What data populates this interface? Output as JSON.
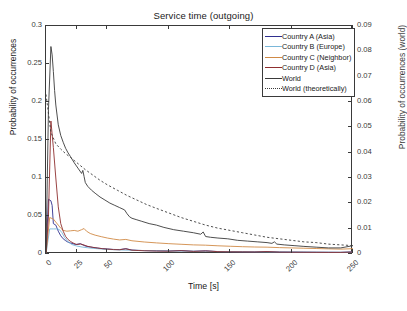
{
  "chart_data": {
    "type": "line",
    "title": "Service time (outgoing)",
    "xlabel": "Time [s]",
    "ylabel": "Probability of occurrences",
    "ylabel_right": "Probability of occurrences (world)",
    "xlim": [
      0,
      250
    ],
    "ylim": [
      0,
      0.3
    ],
    "ylim_right": [
      0,
      0.09
    ],
    "xticks": [
      0,
      25,
      50,
      100,
      150,
      200,
      250
    ],
    "xticklabels": [
      "0",
      "25",
      "50",
      "100",
      "150",
      "200",
      "250"
    ],
    "yticks": [
      0,
      0.05,
      0.1,
      0.15,
      0.2,
      0.25,
      0.3
    ],
    "yticklabels": [
      "0",
      "0.05",
      "0.1",
      "0.15",
      "0.2",
      "0.25",
      "0.3"
    ],
    "yticks_right": [
      0,
      0.01,
      0.02,
      0.03,
      0.04,
      0.05,
      0.06,
      0.07,
      0.08,
      0.09
    ],
    "yticklabels_right": [
      "0",
      "0.01",
      "0.02",
      "0.03",
      "0.04",
      "0.05",
      "0.06",
      "0.07",
      "0.08",
      "0.09"
    ],
    "grid": false,
    "legend_position": "top-right",
    "series": [
      {
        "name": "Country A (Asia)",
        "color": "#2f2f8f",
        "style": "solid",
        "axis": "left",
        "x": [
          0,
          2,
          4,
          5,
          6,
          8,
          10,
          12,
          14,
          16,
          18,
          20,
          24,
          28,
          32,
          36,
          40,
          45,
          50,
          55,
          60,
          65,
          70,
          75,
          80,
          90,
          100,
          110,
          120,
          130,
          140,
          150,
          160,
          170,
          180,
          190,
          200,
          210,
          220,
          230,
          240,
          250
        ],
        "y": [
          0.0,
          0.072,
          0.07,
          0.064,
          0.04,
          0.038,
          0.03,
          0.024,
          0.02,
          0.0175,
          0.0155,
          0.0145,
          0.0125,
          0.0135,
          0.0105,
          0.0092,
          0.0082,
          0.0072,
          0.0066,
          0.006,
          0.0058,
          0.007,
          0.0052,
          0.0048,
          0.0045,
          0.0042,
          0.004,
          0.0046,
          0.0036,
          0.0042,
          0.0032,
          0.003,
          0.0029,
          0.0028,
          0.0033,
          0.0026,
          0.0025,
          0.0024,
          0.0023,
          0.0022,
          0.0021,
          0.0028
        ]
      },
      {
        "name": "Country B (Europe)",
        "color": "#7ab7d9",
        "style": "solid",
        "axis": "left",
        "x": [
          0,
          3,
          6,
          9,
          11,
          13,
          15,
          18,
          21,
          25,
          30,
          35,
          40,
          45,
          50,
          60,
          70,
          80,
          90,
          100,
          110,
          120,
          130,
          140,
          150,
          160,
          170,
          180,
          190,
          200,
          210,
          220,
          230,
          240,
          250
        ],
        "y": [
          0.0,
          0.033,
          0.033,
          0.033,
          0.032,
          0.028,
          0.022,
          0.016,
          0.0125,
          0.0105,
          0.009,
          0.008,
          0.0072,
          0.0066,
          0.006,
          0.0054,
          0.0049,
          0.0045,
          0.0042,
          0.0039,
          0.0037,
          0.0035,
          0.0034,
          0.0032,
          0.0031,
          0.003,
          0.0029,
          0.0028,
          0.0027,
          0.0026,
          0.0025,
          0.0024,
          0.0024,
          0.0023,
          0.0025
        ]
      },
      {
        "name": "Country C (Neighbor)",
        "color": "#d08a46",
        "style": "solid",
        "axis": "left",
        "x": [
          0,
          3,
          6,
          8,
          10,
          12,
          14,
          17,
          20,
          23,
          26,
          29,
          31,
          33,
          36,
          40,
          45,
          50,
          55,
          60,
          65,
          70,
          80,
          90,
          100,
          110,
          120,
          130,
          140,
          150,
          160,
          170,
          180,
          190,
          200,
          210,
          220,
          230,
          240,
          250
        ],
        "y": [
          0.0,
          0.048,
          0.046,
          0.042,
          0.038,
          0.034,
          0.031,
          0.03,
          0.0305,
          0.031,
          0.03,
          0.032,
          0.0335,
          0.03,
          0.027,
          0.0248,
          0.0228,
          0.021,
          0.0196,
          0.0185,
          0.0192,
          0.0174,
          0.0158,
          0.0146,
          0.0136,
          0.0128,
          0.012,
          0.0116,
          0.0108,
          0.0102,
          0.0096,
          0.0092,
          0.009,
          0.0084,
          0.008,
          0.0076,
          0.0072,
          0.0068,
          0.0064,
          0.007
        ]
      },
      {
        "name": "Country D (Asia)",
        "color": "#8f2f2f",
        "style": "solid",
        "axis": "left",
        "x": [
          0,
          2,
          4,
          6,
          8,
          10,
          12,
          14,
          16,
          18,
          20,
          22,
          25,
          28,
          31,
          34,
          38,
          42,
          46,
          50,
          55,
          60,
          65,
          70,
          75,
          80,
          90,
          100,
          110,
          120,
          130,
          140,
          150,
          160,
          170,
          180,
          190,
          200,
          210,
          220,
          230,
          240,
          250
        ],
        "y": [
          0.0,
          0.05,
          0.175,
          0.14,
          0.1,
          0.062,
          0.04,
          0.03,
          0.023,
          0.019,
          0.0165,
          0.0145,
          0.0125,
          0.0132,
          0.0118,
          0.01,
          0.0088,
          0.0078,
          0.007,
          0.0064,
          0.0058,
          0.0056,
          0.0068,
          0.005,
          0.0046,
          0.0043,
          0.0039,
          0.0037,
          0.0044,
          0.0034,
          0.004,
          0.0031,
          0.0029,
          0.0028,
          0.0027,
          0.0032,
          0.0025,
          0.0024,
          0.0023,
          0.0022,
          0.0021,
          0.0021,
          0.0026
        ]
      },
      {
        "name": "World",
        "color": "#3a3a3a",
        "style": "solid",
        "axis": "right",
        "x": [
          0,
          2,
          4,
          5,
          6,
          7,
          8,
          10,
          12,
          14,
          16,
          18,
          20,
          23,
          26,
          29,
          30,
          31,
          32,
          34,
          37,
          40,
          44,
          48,
          52,
          56,
          60,
          64,
          66,
          68,
          70,
          74,
          78,
          84,
          90,
          96,
          104,
          112,
          120,
          126,
          128,
          130,
          134,
          140,
          148,
          156,
          164,
          172,
          180,
          184,
          186,
          188,
          194,
          202,
          210,
          220,
          230,
          240,
          250
        ],
        "y_left": [
          0.0,
          0.19,
          0.273,
          0.262,
          0.24,
          0.215,
          0.196,
          0.17,
          0.156,
          0.147,
          0.139,
          0.133,
          0.128,
          0.12,
          0.113,
          0.106,
          0.11,
          0.102,
          0.094,
          0.089,
          0.084,
          0.08,
          0.075,
          0.071,
          0.067,
          0.064,
          0.061,
          0.058,
          0.053,
          0.049,
          0.047,
          0.045,
          0.043,
          0.04,
          0.038,
          0.035,
          0.032,
          0.03,
          0.028,
          0.026,
          0.029,
          0.023,
          0.022,
          0.021,
          0.02,
          0.018,
          0.017,
          0.016,
          0.015,
          0.014,
          0.016,
          0.013,
          0.012,
          0.011,
          0.01,
          0.009,
          0.008,
          0.008,
          0.011
        ]
      },
      {
        "name": "World (theoretically)",
        "color": "#3a3a3a",
        "style": "dotted",
        "axis": "right",
        "x": [
          0,
          4,
          8,
          12,
          16,
          20,
          26,
          32,
          38,
          44,
          50,
          58,
          66,
          74,
          82,
          90,
          100,
          110,
          120,
          130,
          140,
          150,
          160,
          170,
          180,
          190,
          200,
          210,
          220,
          230,
          240,
          250
        ],
        "y_left": [
          0.21,
          0.16,
          0.145,
          0.138,
          0.132,
          0.127,
          0.119,
          0.111,
          0.104,
          0.097,
          0.091,
          0.084,
          0.077,
          0.071,
          0.065,
          0.06,
          0.054,
          0.048,
          0.043,
          0.038,
          0.034,
          0.031,
          0.028,
          0.025,
          0.022,
          0.02,
          0.018,
          0.016,
          0.015,
          0.013,
          0.012,
          0.011
        ]
      }
    ]
  },
  "legend": {
    "items": [
      {
        "label": "Country A (Asia)"
      },
      {
        "label": "Country B (Europe)"
      },
      {
        "label": "Country C (Neighbor)"
      },
      {
        "label": "Country D (Asia)"
      },
      {
        "label": "World"
      },
      {
        "label": "World (theoretically)"
      }
    ]
  }
}
